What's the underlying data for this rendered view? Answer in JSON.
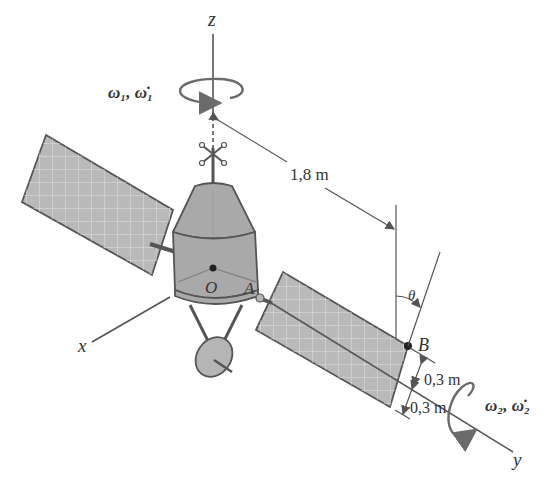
{
  "diagram": {
    "axes": {
      "z": "z",
      "x": "x",
      "y": "y"
    },
    "points": {
      "O": "O",
      "A": "A",
      "B": "B"
    },
    "angle_label": "θ",
    "dimensions": {
      "distance_OB_along_y": "1,8 m",
      "panel_half_width_1": "0,3 m",
      "panel_half_width_2": "0,3 m"
    },
    "rotations": {
      "body_rate": "ω₁, ω̇₁",
      "panel_rate": "ω₂, ω̇₂"
    },
    "colors": {
      "body_fill": "#a9a9a9",
      "panel_fill": "#b9b9b9",
      "line": "#555555"
    }
  }
}
